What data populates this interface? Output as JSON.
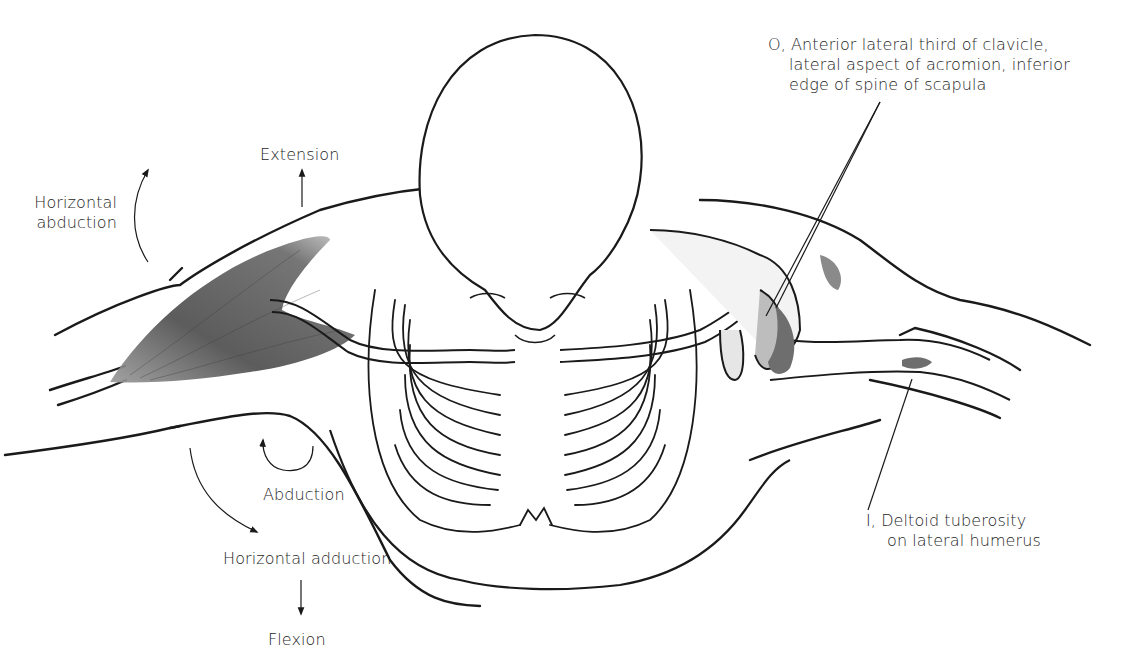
{
  "figure": {
    "colors": {
      "line": "#1a1a1a",
      "muscle_shade": "#5a5a5a",
      "bone_shade": "#8a8a8a",
      "background": "#ffffff"
    }
  },
  "labels": {
    "origin": {
      "lines": [
        "O, Anterior lateral third of clavicle,",
        "lateral aspect of acromion, inferior",
        "edge of spine of scapula"
      ]
    },
    "insertion": {
      "lines": [
        "I, Deltoid tuberosity",
        "on lateral humerus"
      ]
    },
    "motions": {
      "extension": "Extension",
      "horizontal_abduction": [
        "Horizontal",
        "abduction"
      ],
      "abduction": "Abduction",
      "horizontal_adduction": "Horizontal adduction",
      "flexion": "Flexion"
    }
  }
}
